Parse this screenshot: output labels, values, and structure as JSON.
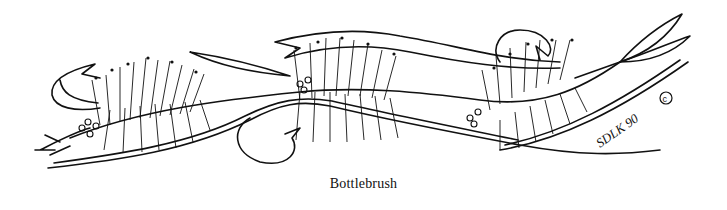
{
  "artwork": {
    "subject": "Bottlebrush flowers with ribbon banners",
    "signature": "SDLK 90",
    "copyright_symbol": "©",
    "ink_color": "#111111",
    "background_color": "#ffffff"
  },
  "caption": "Bottlebrush"
}
